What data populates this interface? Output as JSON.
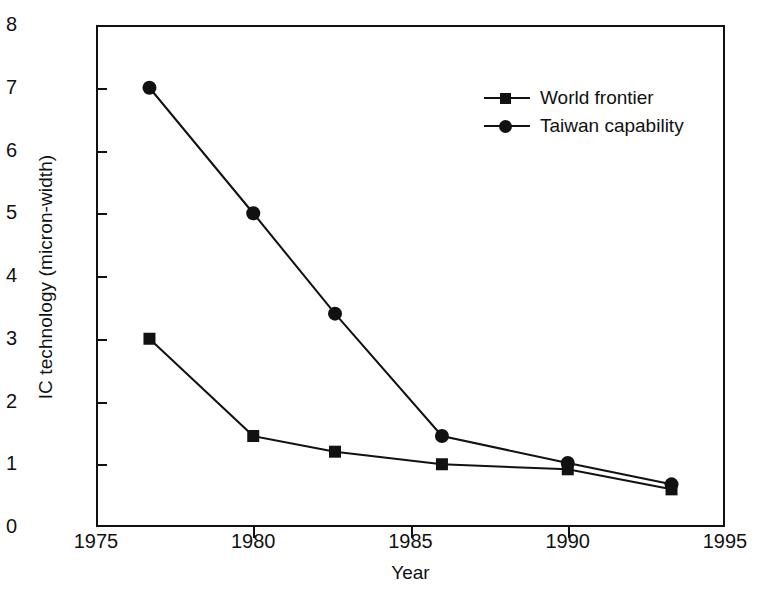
{
  "chart_data": {
    "type": "line",
    "title": "",
    "xlabel": "Year",
    "ylabel": "IC technology (micron-width)",
    "xlim": [
      1975,
      1995
    ],
    "ylim": [
      0,
      8
    ],
    "xticks": [
      1975,
      1980,
      1985,
      1990,
      1995
    ],
    "yticks": [
      0,
      1,
      2,
      3,
      4,
      5,
      6,
      7,
      8
    ],
    "xtick_labels": [
      "1975",
      "1980",
      "1985",
      "1990",
      "1995"
    ],
    "ytick_labels": [
      "0",
      "1",
      "2",
      "3",
      "4",
      "5",
      "6",
      "7",
      "8"
    ],
    "grid": false,
    "legend_position": "upper right",
    "series": [
      {
        "name": "World frontier",
        "marker": "square",
        "color": "#111111",
        "x": [
          1976.7,
          1980.0,
          1982.6,
          1986.0,
          1990.0,
          1993.3
        ],
        "values": [
          3.0,
          1.45,
          1.2,
          1.0,
          0.92,
          0.6
        ]
      },
      {
        "name": "Taiwan capability",
        "marker": "circle",
        "color": "#111111",
        "x": [
          1976.7,
          1980.0,
          1982.6,
          1986.0,
          1990.0,
          1993.3
        ],
        "values": [
          7.0,
          5.0,
          3.4,
          1.45,
          1.02,
          0.68
        ]
      }
    ]
  },
  "axes": {
    "x_title": "Year",
    "y_title": "IC technology (micron-width)"
  },
  "legend": {
    "entries": [
      {
        "label": "World frontier",
        "marker": "square-marker"
      },
      {
        "label": "Taiwan capability",
        "marker": "circle-marker"
      }
    ]
  },
  "style": {
    "axis_color": "#111111",
    "series_color": "#111111",
    "background": "#ffffff"
  }
}
